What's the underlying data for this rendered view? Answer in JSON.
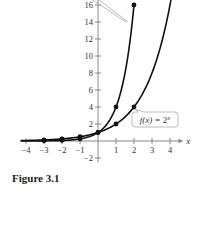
{
  "caption": "Figure 3.1",
  "chart_data": {
    "type": "line",
    "title": "",
    "xlabel": "x",
    "ylabel": "",
    "xlim": [
      -4.3,
      4.6
    ],
    "ylim": [
      -2.5,
      16.6
    ],
    "x_ticks": [
      -4,
      -3,
      -2,
      -1,
      1,
      2,
      3,
      4
    ],
    "y_ticks": [
      -2,
      2,
      4,
      6,
      8,
      10,
      12,
      14,
      16
    ],
    "grid": false,
    "series": [
      {
        "name": "f(x) = 2^x",
        "label": "f(x) = 2^x",
        "points": [
          [
            -3,
            0.125
          ],
          [
            -2,
            0.25
          ],
          [
            -1,
            0.5
          ],
          [
            0,
            1
          ],
          [
            1,
            2
          ],
          [
            2,
            4
          ]
        ]
      },
      {
        "name": "g(x) = 4^x",
        "label": "",
        "points": [
          [
            -3,
            0.016
          ],
          [
            -2,
            0.0625
          ],
          [
            -1,
            0.25
          ],
          [
            0,
            1
          ],
          [
            1,
            4
          ],
          [
            2,
            16
          ]
        ]
      }
    ],
    "annotations": [
      {
        "text": "f(x) = 2^x",
        "target": [
          2,
          4
        ]
      }
    ]
  },
  "colors": {
    "curve": "#111111",
    "axis": "#888888",
    "label": "#333333",
    "callout_border": "#aaaaaa"
  }
}
